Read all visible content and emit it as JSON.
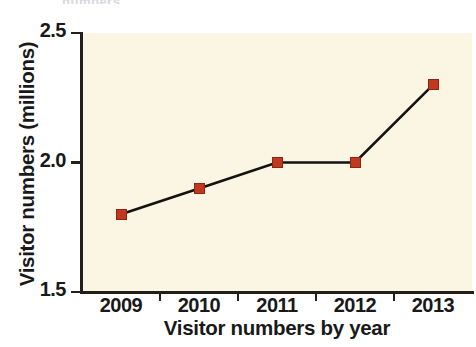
{
  "figure": {
    "top_crop_text": "numbers",
    "plot_background": "#FBF6E3",
    "axis_color": "#23201C",
    "line_color": "#121212",
    "marker_color": "#C2381F",
    "marker_edge_color": "#8E2413"
  },
  "chart_data": {
    "type": "line",
    "title": "",
    "xlabel": "Visitor numbers by year",
    "ylabel": "Visitor numbers (millions)",
    "categories": [
      "2009",
      "2010",
      "2011",
      "2012",
      "2013"
    ],
    "values": [
      1.8,
      1.9,
      2.0,
      2.0,
      2.3
    ],
    "series": [
      {
        "name": "Visitor numbers",
        "values": [
          1.8,
          1.9,
          2.0,
          2.0,
          2.3
        ]
      }
    ],
    "ylim": [
      1.5,
      2.5
    ],
    "yticks": [
      1.5,
      2.0,
      2.5
    ],
    "ytick_labels": [
      "1.5",
      "2.0",
      "2.5"
    ],
    "xtick_labels": [
      "2009",
      "2010",
      "2011",
      "2012",
      "2013"
    ],
    "grid": false,
    "legend": false,
    "legend_position": "none",
    "marker": "square",
    "units": "millions"
  }
}
